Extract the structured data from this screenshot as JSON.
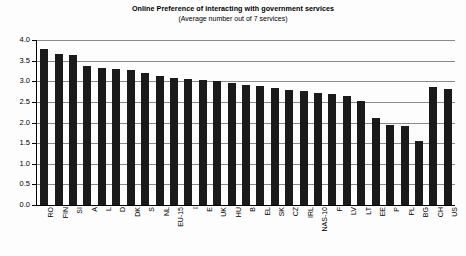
{
  "chart_data": {
    "type": "bar",
    "title": "Online Preference of interacting with government services",
    "subtitle": "(Average number out of 7 services)",
    "xlabel": "",
    "ylabel": "",
    "ylim": [
      0.0,
      4.0
    ],
    "ytick_labels": [
      "4.0",
      "3.5",
      "3.0",
      "2.5",
      "2.0",
      "1.5",
      "1.0",
      "0.5",
      "0.0"
    ],
    "ytick_values": [
      4.0,
      3.5,
      3.0,
      2.5,
      2.0,
      1.5,
      1.0,
      0.5,
      0.0
    ],
    "grid": true,
    "legend": false,
    "bar_color": "#1a1a1a",
    "categories": [
      "RO",
      "FIN",
      "SI",
      "A",
      "L",
      "D",
      "DK",
      "S",
      "NL",
      "EU-15",
      "I",
      "E",
      "UK",
      "HU",
      "B",
      "EL",
      "SK",
      "CZ",
      "IRL",
      "NAS-10",
      "F",
      "LV",
      "LT",
      "EE",
      "P",
      "PL",
      "BG",
      "CH",
      "US"
    ],
    "values": [
      3.78,
      3.66,
      3.64,
      3.38,
      3.32,
      3.3,
      3.28,
      3.2,
      3.12,
      3.08,
      3.06,
      3.03,
      3.0,
      2.96,
      2.92,
      2.88,
      2.84,
      2.8,
      2.76,
      2.72,
      2.68,
      2.64,
      2.52,
      2.1,
      1.95,
      1.92,
      1.55,
      2.85,
      2.82
    ]
  }
}
